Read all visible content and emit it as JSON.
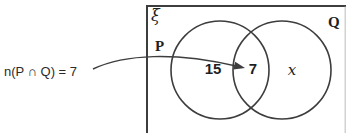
{
  "figure": {
    "annotation": {
      "text": "n(P ∩ Q) = 7"
    },
    "universal_set": {
      "label": "ξ"
    },
    "set_p": {
      "label": "P",
      "only_value": "15"
    },
    "set_q": {
      "label": "Q",
      "only_value": "x"
    },
    "intersection": {
      "value": "7"
    },
    "colors": {
      "line": "#3d3d3d",
      "faint_edge": "#9a9a9a"
    }
  }
}
